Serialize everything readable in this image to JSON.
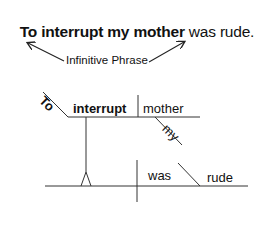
{
  "sentence": {
    "bold_part": "To interrupt my mother",
    "plain_part": " was rude."
  },
  "annotation": {
    "label": "Infinitive Phrase"
  },
  "diagram": {
    "infinitive_marker": "To",
    "verb": "interrupt",
    "object": "mother",
    "object_modifier": "my",
    "main_verb": "was",
    "predicate_adjective": "rude"
  },
  "colors": {
    "line": "#333333",
    "text": "#111111",
    "background": "#ffffff"
  }
}
